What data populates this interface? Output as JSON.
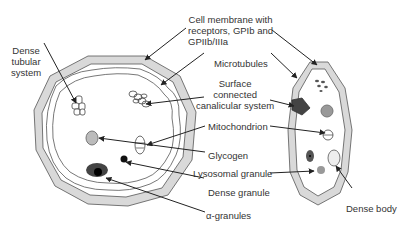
{
  "figure": {
    "type": "platelet-structure-diagram",
    "cells": [
      "resting-platelet-cross-section",
      "platelet-longitudinal-section"
    ]
  },
  "labels": {
    "cell_membrane": [
      "Cell membrane with",
      "receptors, GPIb and",
      "GPIIb/IIIa"
    ],
    "dense_tubular": [
      "Dense",
      "tubular",
      "system"
    ],
    "microtubules": "Microtubules",
    "sccs": [
      "Surface",
      "connected",
      "canalicular system"
    ],
    "mitochondrion": "Mitochondrion",
    "glycogen": "Glycogen",
    "lysosomal": "Lysosomal granule",
    "dense_granule": "Dense granule",
    "alpha_granules": "α-granules",
    "dense_body": "Dense body"
  },
  "colors": {
    "membrane_fill": "#d9d9d9",
    "outline": "#555555",
    "arrow": "#222222",
    "dark_granule": "#3a3a3a",
    "gray_granule": "#9a9a9a"
  }
}
